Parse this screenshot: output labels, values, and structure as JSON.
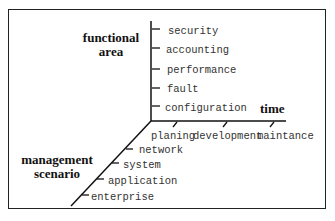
{
  "diagram": {
    "axes": {
      "functional_area": {
        "label_line1": "functional",
        "label_line2": "area",
        "ticks": [
          "security",
          "accounting",
          "performance",
          "fault",
          "configuration"
        ]
      },
      "time": {
        "label": "time",
        "ticks": [
          "planing",
          "development",
          "maintance"
        ]
      },
      "management_scenario": {
        "label_line1": "management",
        "label_line2": "scenario",
        "ticks": [
          "network",
          "system",
          "application",
          "enterprise"
        ]
      }
    }
  }
}
